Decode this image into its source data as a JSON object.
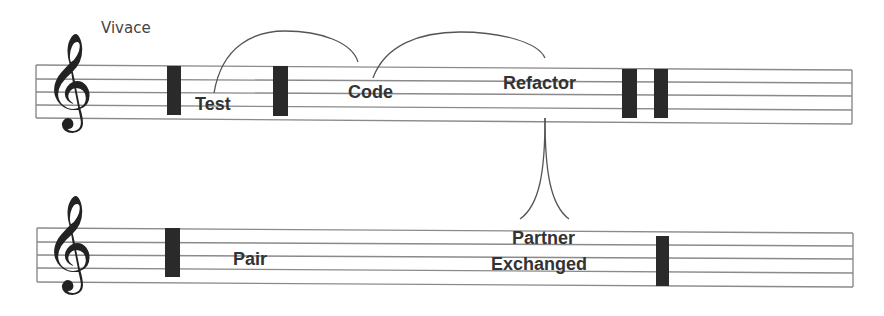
{
  "tempo": "Vivace",
  "colors": {
    "staff_line": "#8a8a8a",
    "bar": "#2a2a2a",
    "text": "#333333",
    "curve": "#555555"
  },
  "staff1": {
    "clef": "treble-clef",
    "clef_glyph": "𝄞",
    "labels": {
      "test": "Test",
      "code": "Code",
      "refactor": "Refactor"
    }
  },
  "staff2": {
    "clef": "treble-clef",
    "clef_glyph": "𝄞",
    "labels": {
      "pair": "Pair",
      "partner_line1": "Partner",
      "partner_line2": "Exchanged"
    }
  }
}
